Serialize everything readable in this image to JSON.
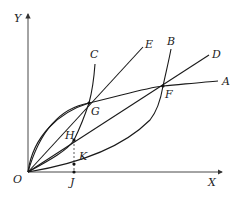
{
  "diagram": {
    "axes": {
      "x_label": "X",
      "y_label": "Y",
      "origin_label": "O"
    },
    "curves": [
      {
        "name": "OA",
        "end_label": "A",
        "kind": "concave curve"
      },
      {
        "name": "OB",
        "end_label": "B",
        "kind": "convex curve"
      },
      {
        "name": "OC",
        "end_label": "C",
        "kind": "curve"
      },
      {
        "name": "OD",
        "end_label": "D",
        "kind": "straight line"
      },
      {
        "name": "OE",
        "end_label": "E",
        "kind": "straight line"
      }
    ],
    "points": {
      "F": "F",
      "G": "G",
      "H": "H",
      "K": "K",
      "J": "J"
    }
  }
}
